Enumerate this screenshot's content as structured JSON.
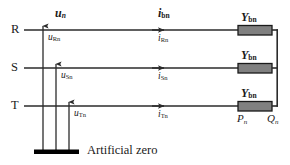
{
  "figure": {
    "type": "electrical-circuit-diagram",
    "colors": {
      "line": "#2b2b2b",
      "text": "#1a1a1a",
      "box_fill": "#808080",
      "box_stroke": "#1a1a1a",
      "ground_bar": "#000000",
      "background": "#ffffff"
    }
  },
  "phases": [
    {
      "name": "phase-r",
      "label": "R",
      "voltage_label": "u",
      "voltage_sub": "Rn",
      "current_label": "i",
      "current_sub": "Rn"
    },
    {
      "name": "phase-s",
      "label": "S",
      "voltage_label": "u",
      "voltage_sub": "Sn",
      "current_label": "i",
      "current_sub": "Sn"
    },
    {
      "name": "phase-t",
      "label": "T",
      "voltage_label": "u",
      "voltage_sub": "Tn",
      "current_label": "i",
      "current_sub": "Tn"
    }
  ],
  "vectors": {
    "voltage_vector": {
      "symbol": "u",
      "subscript": "n"
    },
    "current_vector": {
      "symbol": "i",
      "subscript": "bn"
    }
  },
  "admittances": [
    {
      "symbol": "Y",
      "subscript": "bn"
    },
    {
      "symbol": "Y",
      "subscript": "bn"
    },
    {
      "symbol": "Y",
      "subscript": "bn"
    }
  ],
  "terminals": {
    "p": {
      "symbol": "P",
      "subscript": "n"
    },
    "q": {
      "symbol": "Q",
      "subscript": "n"
    }
  },
  "ground": {
    "caption": "Artificial zero"
  }
}
